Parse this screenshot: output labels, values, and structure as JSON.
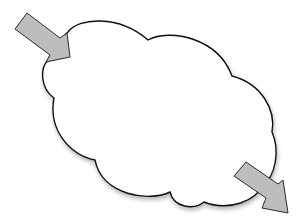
{
  "diagram": {
    "type": "cloud-with-arrows",
    "background": "#ffffff",
    "cloud": {
      "fill": "#ffffff",
      "stroke": "#111111",
      "shadow": "#c8c8c8"
    },
    "arrows": [
      {
        "id": "input-arrow",
        "direction": "into-cloud",
        "position": "top-left",
        "fill": "#bdbdbd",
        "stroke": "#2a2a2a"
      },
      {
        "id": "output-arrow",
        "direction": "out-of-cloud",
        "position": "bottom-right",
        "fill": "#bdbdbd",
        "stroke": "#2a2a2a"
      }
    ]
  }
}
